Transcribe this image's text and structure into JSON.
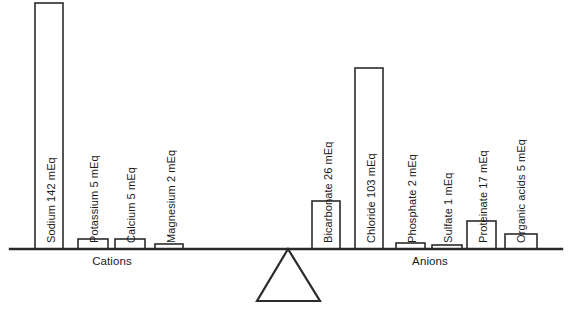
{
  "figure": {
    "title": "",
    "colors": {
      "stroke": "#2b2b2b",
      "fill": "#ffffff",
      "text": "#1a1a1a",
      "background": "#ffffff"
    }
  },
  "groups": {
    "left_label": "Cations",
    "right_label": "Anions"
  },
  "chart_data": {
    "type": "bar",
    "title": "",
    "subtitle": "",
    "xlabel": "",
    "ylabel": "",
    "unit": "mEq",
    "grid": false,
    "legend": "none",
    "ylim": [
      0,
      142
    ],
    "annotations": [
      "Cations",
      "Anions"
    ],
    "groups": [
      "Cations",
      "Anions"
    ],
    "categories": [
      "Sodium",
      "Potassium",
      "Calcium",
      "Magnesium",
      "Bicarbonate",
      "Chloride",
      "Phosphate",
      "Sulfate",
      "Proteinate",
      "Organic acids"
    ],
    "values": [
      142,
      5,
      5,
      2,
      26,
      103,
      2,
      1,
      17,
      5
    ],
    "bars": [
      {
        "name": "sodium",
        "label": "Sodium 142 mEq",
        "category": "Sodium",
        "value": 142,
        "unit": "mEq",
        "group": "Cations",
        "x": 35,
        "width": 28,
        "top": 3
      },
      {
        "name": "potassium",
        "label": "Potassium 5 mEq",
        "category": "Potassium",
        "value": 5,
        "unit": "mEq",
        "group": "Cations",
        "x": 78,
        "width": 30,
        "top": 239
      },
      {
        "name": "calcium",
        "label": "Calcium 5 mEq",
        "category": "Calcium",
        "value": 5,
        "unit": "mEq",
        "group": "Cations",
        "x": 115,
        "width": 30,
        "top": 239
      },
      {
        "name": "magnesium",
        "label": "Magnesium 2 mEq",
        "category": "Magnesium",
        "value": 2,
        "unit": "mEq",
        "group": "Cations",
        "x": 155,
        "width": 28,
        "top": 244
      },
      {
        "name": "bicarbonate",
        "label": "Bicarbonate 26 mEq",
        "category": "Bicarbonate",
        "value": 26,
        "unit": "mEq",
        "group": "Anions",
        "x": 312,
        "width": 28,
        "top": 201
      },
      {
        "name": "chloride",
        "label": "Chloride 103 mEq",
        "category": "Chloride",
        "value": 103,
        "unit": "mEq",
        "group": "Anions",
        "x": 355,
        "width": 28,
        "top": 68
      },
      {
        "name": "phosphate",
        "label": "Phosphate 2 mEq",
        "category": "Phosphate",
        "value": 2,
        "unit": "mEq",
        "group": "Anions",
        "x": 396,
        "width": 29,
        "top": 243
      },
      {
        "name": "sulfate",
        "label": "Sulfate 1 mEq",
        "category": "Sulfate",
        "value": 1,
        "unit": "mEq",
        "group": "Anions",
        "x": 432,
        "width": 30,
        "top": 245
      },
      {
        "name": "proteinate",
        "label": "Proteinate 17 mEq",
        "category": "Proteinate",
        "value": 17,
        "unit": "mEq",
        "group": "Anions",
        "x": 467,
        "width": 29,
        "top": 221
      },
      {
        "name": "organic-acids",
        "label": "Organic acids 5 mEq",
        "category": "Organic acids",
        "value": 5,
        "unit": "mEq",
        "group": "Anions",
        "x": 505,
        "width": 32,
        "top": 234
      }
    ],
    "baseline_y": 249,
    "beam": {
      "x1": 10,
      "x2": 562,
      "y": 249
    },
    "fulcrum": {
      "apex_x": 288,
      "apex_y": 249,
      "left_x": 257,
      "right_x": 320,
      "base_y": 301
    },
    "label_text": {
      "sodium": "Sodium 142 mEq",
      "potassium": "Potassium 5 mEq",
      "calcium": "Calcium 5 mEq",
      "magnesium": "Magnesium 2 mEq",
      "bicarbonate": "Bicarbonate 26 mEq",
      "chloride": "Chloride 103 mEq",
      "phosphate": "Phosphate 2 mEq",
      "sulfate": "Sulfate 1 mEq",
      "proteinate": "Proteinate 17 mEq",
      "organic_acids": "Organic acids 5 mEq"
    }
  }
}
